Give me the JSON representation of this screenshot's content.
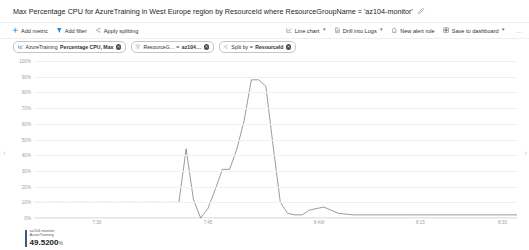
{
  "header": {
    "title": "Max Percentage CPU for AzureTraining in West Europe region by ResourceId where ResourceGroupName = 'az104-monitor'",
    "edit_icon": "pencil-icon"
  },
  "toolbar": {
    "left": [
      {
        "label": "Add metric",
        "icon": "add-icon"
      },
      {
        "label": "Add filter",
        "icon": "filter-icon"
      },
      {
        "label": "Apply splitting",
        "icon": "splitting-icon"
      }
    ],
    "right": [
      {
        "label": "Line chart",
        "icon": "line-chart-icon",
        "has_chevron": true
      },
      {
        "label": "Drill into Logs",
        "icon": "logs-icon",
        "has_chevron": true
      },
      {
        "label": "New alert rule",
        "icon": "alert-icon",
        "has_chevron": false
      },
      {
        "label": "Save to dashboard",
        "icon": "dashboard-icon",
        "has_chevron": true
      }
    ],
    "overflow": "..."
  },
  "chips": [
    {
      "icon": "metric-icon",
      "plain": "AzureTraining",
      "bold": "Percentage CPU, Max",
      "removable": true
    },
    {
      "icon": "filter-icon",
      "plain": "ResourceG… = ",
      "bold": "az104…",
      "removable": true
    },
    {
      "icon": "splitting-icon",
      "plain": "Split by = ",
      "bold": "ResourceId",
      "removable": true
    }
  ],
  "chart_data": {
    "type": "line",
    "title": "Max Percentage CPU for AzureTraining in West Europe region by ResourceId where ResourceGroupName = 'az104-monitor'",
    "xlabel": "",
    "ylabel": "",
    "ylim": [
      0,
      100
    ],
    "yticks": [
      "100%",
      "90%",
      "80%",
      "70%",
      "60%",
      "50%",
      "40%",
      "30%",
      "20%",
      "10%",
      "0%"
    ],
    "ytick_values": [
      100,
      90,
      80,
      70,
      60,
      50,
      40,
      30,
      20,
      10,
      0
    ],
    "grid": true,
    "legend_position": "bottom-left",
    "xticks": [
      "7:30",
      "7:45",
      "8 AM",
      "8:15",
      "8:30"
    ],
    "xtick_positions": [
      0.13,
      0.36,
      0.59,
      0.8,
      0.97
    ],
    "series": [
      {
        "name": "AzureTraining",
        "color": "#4a4a4a",
        "current_value": "49.5200",
        "unit": "%",
        "x": [
          0.0,
          0.04,
          0.08,
          0.12,
          0.16,
          0.2,
          0.24,
          0.27,
          0.3,
          0.315,
          0.33,
          0.345,
          0.36,
          0.375,
          0.39,
          0.405,
          0.42,
          0.435,
          0.45,
          0.465,
          0.48,
          0.495,
          0.51,
          0.525,
          0.54,
          0.555,
          0.57,
          0.6,
          0.63,
          0.66,
          0.7,
          0.74,
          0.78,
          0.82,
          0.86,
          0.9,
          0.94,
          0.97,
          1.0
        ],
        "y": [
          10,
          10,
          10,
          10,
          10,
          10,
          10,
          10,
          10,
          44,
          12,
          0,
          6,
          18,
          31,
          31,
          44,
          62,
          88,
          88,
          84,
          46,
          10,
          3,
          2,
          2,
          5,
          7,
          3,
          2,
          2,
          2,
          2,
          2,
          2,
          2,
          2,
          2,
          2
        ],
        "baseline_dotted_until": 0.3
      }
    ]
  },
  "legend": {
    "series_line1": "az104-monitor",
    "series_line2": "AzureTraining",
    "value": "49.5200",
    "unit": "%"
  },
  "nav": {
    "left": "‹",
    "right": "›"
  }
}
